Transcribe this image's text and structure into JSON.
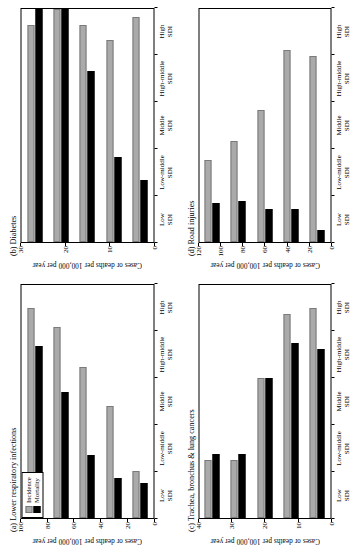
{
  "figure": {
    "axis_label": "Cases or deaths per 100,000 per year",
    "legend": {
      "incidence_label": "Incidence",
      "mortality_label": "Mortality",
      "incidence_color": "#aaaaaa",
      "mortality_color": "#000000"
    },
    "categories": [
      "Low SDI",
      "Low-middle SDI",
      "Middle SDI",
      "High-middle SDI",
      "High SDI"
    ]
  },
  "chart_data": [
    {
      "id": "panel-a",
      "type": "bar",
      "title": "(a) Lower respiratory infections",
      "orientation": "horizontal",
      "categories": [
        "Low SDI",
        "Low-middle SDI",
        "Middle SDI",
        "High-middle SDI",
        "High SDI"
      ],
      "series": [
        {
          "name": "Incidence",
          "color": "#aaaaaa",
          "values": [
            90,
            82,
            65,
            48,
            20
          ]
        },
        {
          "name": "Mortality",
          "color": "#000000",
          "values": [
            74,
            54,
            27,
            17,
            15
          ]
        }
      ],
      "xlabel": "",
      "ylabel": "Cases or deaths per 100,000 per year",
      "ylim": [
        0,
        100
      ],
      "yticks": [
        0,
        20,
        40,
        60,
        80,
        100
      ],
      "grid": false,
      "legend_position": "top-right"
    },
    {
      "id": "panel-b",
      "type": "bar",
      "title": "(b) Diabetes",
      "orientation": "horizontal",
      "categories": [
        "Low SDI",
        "Low-middle SDI",
        "Middle SDI",
        "High-middle SDI",
        "High SDI"
      ],
      "series": [
        {
          "name": "Incidence",
          "color": "#aaaaaa",
          "values": [
            28,
            30,
            28,
            26,
            29
          ]
        },
        {
          "name": "Mortality",
          "color": "#000000",
          "values": [
            30,
            30,
            22,
            11,
            8
          ]
        }
      ],
      "xlabel": "",
      "ylabel": "Cases or deaths per 100,000 per year",
      "ylim": [
        0,
        30
      ],
      "yticks": [
        0,
        10,
        20,
        30
      ],
      "grid": false,
      "legend_position": "none"
    },
    {
      "id": "panel-c",
      "type": "bar",
      "title": "(c) Trachea, bronchus & lung cancers",
      "orientation": "horizontal",
      "categories": [
        "Low SDI",
        "Low-middle SDI",
        "Middle SDI",
        "High-middle SDI",
        "High SDI"
      ],
      "series": [
        {
          "name": "Incidence",
          "color": "#aaaaaa",
          "values": [
            10,
            10,
            24,
            35,
            36
          ]
        },
        {
          "name": "Mortality",
          "color": "#000000",
          "values": [
            11,
            11,
            24,
            30,
            29
          ]
        }
      ],
      "xlabel": "",
      "ylabel": "Cases or deaths per 100,000 per year",
      "ylim": [
        0,
        40
      ],
      "yticks": [
        0,
        10,
        20,
        30,
        40
      ],
      "grid": false,
      "legend_position": "none"
    },
    {
      "id": "panel-d",
      "type": "bar",
      "title": "(d) Road injuries",
      "orientation": "horizontal",
      "categories": [
        "Low SDI",
        "Low-middle SDI",
        "Middle SDI",
        "High-middle SDI",
        "High SDI"
      ],
      "series": [
        {
          "name": "Incidence",
          "color": "#aaaaaa",
          "values": [
            42,
            52,
            68,
            99,
            96
          ]
        },
        {
          "name": "Mortality",
          "color": "#000000",
          "values": [
            20,
            21,
            17,
            17,
            6
          ]
        }
      ],
      "xlabel": "",
      "ylabel": "Cases or deaths per 100,000 per year",
      "ylim": [
        0,
        120
      ],
      "yticks": [
        0,
        20,
        40,
        60,
        80,
        100,
        120
      ],
      "grid": false,
      "legend_position": "none"
    }
  ]
}
